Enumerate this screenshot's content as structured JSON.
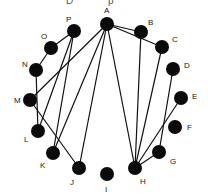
{
  "diagram": {
    "type": "circular-graph",
    "top_cropped_text": "D p",
    "nodes": [
      {
        "id": "A",
        "x": 107,
        "y": 24,
        "lx": 104,
        "ly": 13
      },
      {
        "id": "B",
        "x": 141,
        "y": 32,
        "lx": 148,
        "ly": 25
      },
      {
        "id": "C",
        "x": 162,
        "y": 47,
        "lx": 172,
        "ly": 42
      },
      {
        "id": "D",
        "x": 173,
        "y": 69,
        "lx": 184,
        "ly": 68
      },
      {
        "id": "E",
        "x": 181,
        "y": 98,
        "lx": 192,
        "ly": 99
      },
      {
        "id": "F",
        "x": 175,
        "y": 127,
        "lx": 187,
        "ly": 130
      },
      {
        "id": "G",
        "x": 159,
        "y": 152,
        "lx": 170,
        "ly": 164
      },
      {
        "id": "H",
        "x": 135,
        "y": 168,
        "lx": 140,
        "ly": 184
      },
      {
        "id": "I",
        "x": 107,
        "y": 174,
        "lx": 105,
        "ly": 192
      },
      {
        "id": "J",
        "x": 79,
        "y": 168,
        "lx": 70,
        "ly": 185
      },
      {
        "id": "K",
        "x": 53,
        "y": 153,
        "lx": 40,
        "ly": 168
      },
      {
        "id": "L",
        "x": 38,
        "y": 131,
        "lx": 24,
        "ly": 142
      },
      {
        "id": "M",
        "x": 30,
        "y": 100,
        "lx": 14,
        "ly": 103
      },
      {
        "id": "N",
        "x": 36,
        "y": 70,
        "lx": 22,
        "ly": 67
      },
      {
        "id": "O",
        "x": 51,
        "y": 48,
        "lx": 41,
        "ly": 39
      },
      {
        "id": "P",
        "x": 74,
        "y": 31,
        "lx": 66,
        "ly": 22
      }
    ],
    "edges": [
      [
        "A",
        "B"
      ],
      [
        "A",
        "C"
      ],
      [
        "A",
        "M"
      ],
      [
        "A",
        "K"
      ],
      [
        "A",
        "J"
      ],
      [
        "A",
        "H"
      ],
      [
        "P",
        "O"
      ],
      [
        "O",
        "N"
      ],
      [
        "N",
        "L"
      ],
      [
        "P",
        "K"
      ],
      [
        "P",
        "L"
      ],
      [
        "M",
        "J"
      ],
      [
        "B",
        "H"
      ],
      [
        "C",
        "H"
      ],
      [
        "D",
        "G"
      ],
      [
        "E",
        "H"
      ],
      [
        "G",
        "H"
      ]
    ],
    "node_radius": 7,
    "colors": {
      "node": "#0a0a0a",
      "edge": "#111111",
      "label": "#222222",
      "background": "#ffffff"
    }
  }
}
